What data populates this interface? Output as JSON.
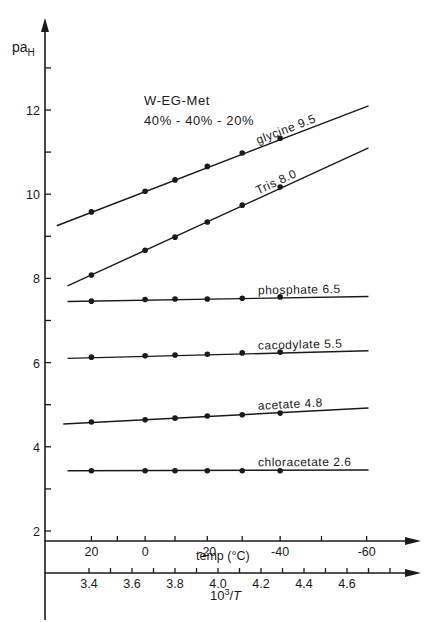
{
  "chart_data": {
    "type": "line",
    "title": "",
    "annotation": [
      "W-EG-Met",
      "40% - 40% - 20%"
    ],
    "ylabel": "pa",
    "ylabel_sub": "H",
    "ylim": [
      1.8,
      14.0
    ],
    "yticks_major": [
      2,
      4,
      6,
      8,
      10,
      12
    ],
    "yticks_minor": [
      3,
      5,
      7,
      9,
      11,
      13
    ],
    "xlabel": "10³/T",
    "xlim": [
      3.25,
      4.95
    ],
    "xticks": [
      3.4,
      3.5,
      3.6,
      3.7,
      3.8,
      3.9,
      4.0,
      4.1,
      4.2,
      4.3,
      4.4,
      4.5,
      4.6,
      4.7,
      4.8
    ],
    "xtick_labels": [
      "3.4",
      "3.6",
      "3.8",
      "4.0",
      "4.2",
      "4.4",
      "4.6"
    ],
    "xtick_label_values": [
      3.4,
      3.6,
      3.8,
      4.0,
      4.2,
      4.4,
      4.6
    ],
    "temp_axis": {
      "label": "temp  (°C)",
      "ticks": [
        20,
        10,
        0,
        -10,
        -20,
        -30,
        -40,
        -50,
        -60
      ],
      "labeled": [
        20,
        0,
        -20,
        -40,
        -60
      ],
      "tick_labels": [
        "20",
        "0",
        "-20",
        "-40",
        "-60"
      ]
    },
    "x_temps_c": [
      20,
      0,
      -10,
      -20,
      -30,
      -40
    ],
    "series": [
      {
        "name": "glycine 9.5",
        "values": [
          9.58,
          10.07,
          10.34,
          10.66,
          10.98,
          11.33
        ],
        "line_range": [
          [
            3.25,
            9.25
          ],
          [
            4.7,
            12.1
          ]
        ]
      },
      {
        "name": "Tris 8.0",
        "values": [
          8.08,
          8.67,
          8.98,
          9.34,
          9.74,
          10.17
        ],
        "line_range": [
          [
            3.3,
            7.82
          ],
          [
            4.7,
            11.1
          ]
        ]
      },
      {
        "name": "phosphate 6.5",
        "values": [
          7.46,
          7.5,
          7.51,
          7.51,
          7.53,
          7.56
        ],
        "line_range": [
          [
            3.3,
            7.45
          ],
          [
            4.7,
            7.57
          ]
        ]
      },
      {
        "name": "cacodylate 5.5",
        "values": [
          6.13,
          6.16,
          6.18,
          6.2,
          6.23,
          6.25
        ],
        "line_range": [
          [
            3.3,
            6.1
          ],
          [
            4.7,
            6.28
          ]
        ]
      },
      {
        "name": "acetate 4.8",
        "values": [
          4.59,
          4.64,
          4.68,
          4.73,
          4.76,
          4.8
        ],
        "line_range": [
          [
            3.28,
            4.54
          ],
          [
            4.7,
            4.92
          ]
        ]
      },
      {
        "name": "chloracetate 2.6",
        "values": [
          3.43,
          3.43,
          3.43,
          3.43,
          3.43,
          3.43
        ],
        "line_range": [
          [
            3.3,
            3.43
          ],
          [
            4.7,
            3.45
          ]
        ]
      }
    ]
  }
}
